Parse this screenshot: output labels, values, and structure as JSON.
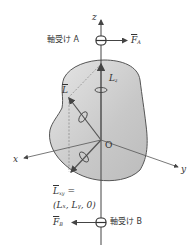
{
  "diagram": {
    "axes": {
      "x": "x",
      "y": "y",
      "z": "z",
      "origin": "O"
    },
    "bearing_a": {
      "label": "軸受け A",
      "force": "F",
      "force_sub": "A"
    },
    "bearing_b": {
      "label": "軸受け B",
      "force": "F",
      "force_sub": "B"
    },
    "vectors": {
      "L": "L",
      "Lz": "L",
      "Lz_sub": "z",
      "Lxy": "L",
      "Lxy_sub": "xy",
      "Lxy_eq": "=",
      "Lxy_components": "(Lₓ, Lᵧ, 0)"
    },
    "colors": {
      "body_fill": "#c9c9c9",
      "body_edge": "#555555",
      "axis": "#444444",
      "vector": "#555555"
    }
  }
}
